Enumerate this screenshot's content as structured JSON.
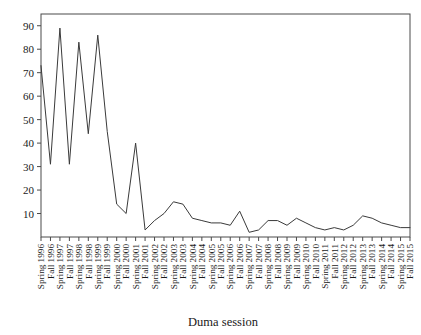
{
  "chart_data": {
    "type": "line",
    "title": "",
    "subtitle": "",
    "xlabel": "Duma session",
    "ylabel": "",
    "grid": false,
    "legend": false,
    "legend_position": "none",
    "xlim": [
      0,
      39
    ],
    "ylim": [
      0,
      95
    ],
    "ytick_values": [
      10,
      20,
      30,
      40,
      50,
      60,
      70,
      80,
      90
    ],
    "ytick_labels": [
      "10",
      "20",
      "30",
      "40",
      "50",
      "60",
      "70",
      "80",
      "90"
    ],
    "categories": [
      "Spring 1996",
      "Fall 1996",
      "Spring 1997",
      "Fall 1997",
      "Spring 1998",
      "Fall 1998",
      "Spring 1999",
      "Fall 1999",
      "Spring 2000",
      "Fall 2000",
      "Spring 2001",
      "Fall 2001",
      "Spring 2002",
      "Fall 2002",
      "Spring 2003",
      "Fall 2003",
      "Spring 2004",
      "Fall 2004",
      "Spring 2005",
      "Fall 2005",
      "Spring 2006",
      "Fall 2006",
      "Spring 2007",
      "Fall 2007",
      "Spring 2008",
      "Fall 2008",
      "Spring 2009",
      "Fall 2009",
      "Spring 2010",
      "Fall 2010",
      "Spring 2011",
      "Fall 2011",
      "Spring 2012",
      "Fall 2012",
      "Spring 2013",
      "Fall 2013",
      "Spring 2014",
      "Fall 2014",
      "Spring 2015",
      "Fall 2015"
    ],
    "values": [
      73,
      31,
      89,
      31,
      83,
      44,
      86,
      45,
      14,
      10,
      40,
      3,
      7,
      10,
      15,
      14,
      8,
      7,
      6,
      6,
      5,
      11,
      2,
      3,
      7,
      7,
      5,
      8,
      6,
      4,
      3,
      4,
      3,
      5,
      9,
      8,
      6,
      5,
      4,
      4
    ],
    "series": [
      {
        "name": "Duma session count",
        "color": "#3a3a3a",
        "values": [
          73,
          31,
          89,
          31,
          83,
          44,
          86,
          45,
          14,
          10,
          40,
          3,
          7,
          10,
          15,
          14,
          8,
          7,
          6,
          6,
          5,
          11,
          2,
          3,
          7,
          7,
          5,
          8,
          6,
          4,
          3,
          4,
          3,
          5,
          9,
          8,
          6,
          5,
          4,
          4
        ]
      }
    ]
  },
  "layout": {
    "plot_left": 41,
    "plot_right": 410,
    "plot_top": 14,
    "plot_bottom": 237
  },
  "colors": {
    "line": "#3a3a3a",
    "frame": "#4a4a4a",
    "text": "#1a1a1a",
    "background": "#ffffff"
  }
}
